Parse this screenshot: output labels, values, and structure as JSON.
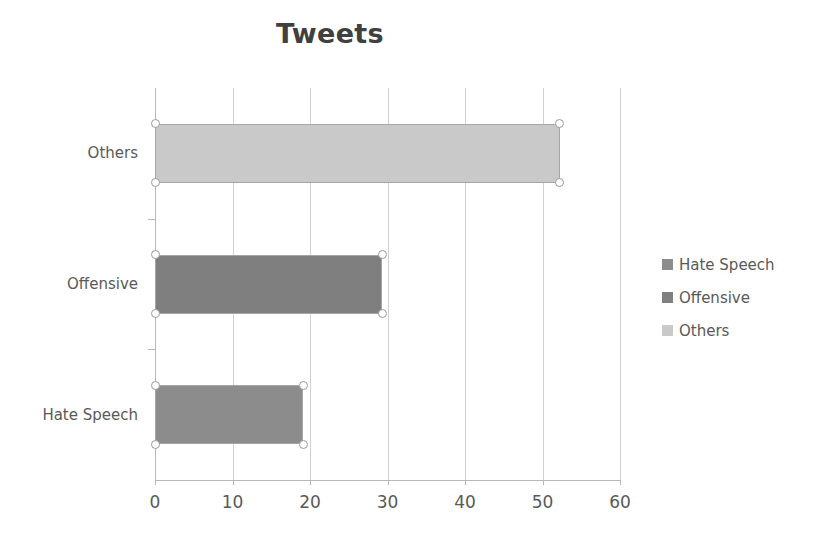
{
  "chart_data": {
    "type": "bar",
    "orientation": "horizontal",
    "title": "Tweets",
    "xlabel": "",
    "ylabel": "",
    "categories": [
      "Hate Speech",
      "Offensive",
      "Others"
    ],
    "values": [
      19.1,
      29.3,
      52.2
    ],
    "series": [
      {
        "name": "Hate Speech",
        "value": 19.1,
        "color": "#8c8c8c"
      },
      {
        "name": "Offensive",
        "value": 29.3,
        "color": "#7f7f7f"
      },
      {
        "name": "Others",
        "value": 52.2,
        "color": "#c9c9c9"
      }
    ],
    "xlim": [
      0,
      60
    ],
    "xticks": [
      "0",
      "10",
      "20",
      "30",
      "40",
      "50",
      "60"
    ],
    "xtick_values": [
      0,
      10,
      20,
      30,
      40,
      50,
      60
    ],
    "grid": true,
    "grid_axis": "x",
    "legend": {
      "position": "right",
      "entries": [
        {
          "label": "Hate Speech",
          "color": "#8c8c8c"
        },
        {
          "label": "Offensive",
          "color": "#7f7f7f"
        },
        {
          "label": "Others",
          "color": "#c9c9c9"
        }
      ]
    },
    "selected": true,
    "colors": {
      "title": "#404040",
      "text": "#595959",
      "gridline": "#d0d0d0",
      "axis": "#b7b7b7",
      "bar_border": "#a6a6a6",
      "background": "#ffffff"
    }
  }
}
